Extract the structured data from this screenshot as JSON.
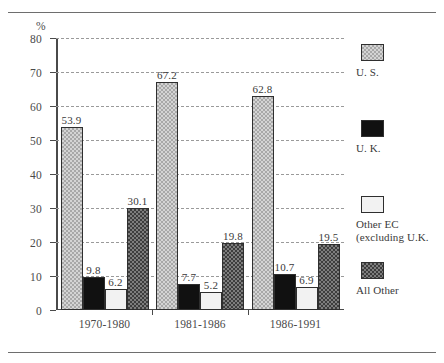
{
  "chart_data": {
    "type": "bar",
    "title": "",
    "subtitle": "",
    "xlabel": "",
    "ylabel": "%",
    "axis_unit": "%",
    "ylim": [
      0,
      80
    ],
    "yticks": [
      0,
      10,
      20,
      30,
      40,
      50,
      60,
      70,
      80
    ],
    "ytick_labels": [
      "0",
      "10",
      "20",
      "30",
      "40",
      "50",
      "60",
      "70",
      "80"
    ],
    "grid": true,
    "grid_style": "dashed horizontal",
    "legend_position": "right",
    "categories": [
      "1970-1980",
      "1981-1986",
      "1986-1991"
    ],
    "series": [
      {
        "name": "U. S.",
        "pattern": "light-checker",
        "color": "#d4d4d4",
        "values": [
          53.9,
          67.2,
          62.8
        ],
        "value_labels": [
          "53.9",
          "67.2",
          "62.8"
        ]
      },
      {
        "name": "U. K.",
        "pattern": "solid-black",
        "color": "#111111",
        "values": [
          9.8,
          7.7,
          10.7
        ],
        "value_labels": [
          "9.8",
          "7.7",
          "10.7"
        ]
      },
      {
        "name": "Other EC (excluding U.K.",
        "pattern": "solid-white",
        "color": "#f2f2f2",
        "values": [
          6.2,
          5.2,
          6.9
        ],
        "value_labels": [
          "6.2",
          "5.2",
          "6.9"
        ]
      },
      {
        "name": "All Other",
        "pattern": "dark-checker",
        "color": "#7d7d7d",
        "values": [
          30.1,
          19.8,
          19.5
        ],
        "value_labels": [
          "30.1",
          "19.8",
          "19.5"
        ]
      }
    ]
  },
  "legend": {
    "entries": [
      {
        "label": "U. S."
      },
      {
        "label": "U. K."
      },
      {
        "label_line1": "Other EC",
        "label_line2": "(excluding U.K."
      },
      {
        "label": "All Other"
      }
    ]
  }
}
